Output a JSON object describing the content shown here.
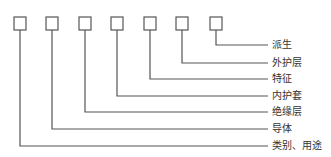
{
  "diagram": {
    "type": "cable-model-code-structure",
    "box_count": 7,
    "labels": [
      "派生",
      "外护层",
      "特征",
      "内护套",
      "绝缘层",
      "导体",
      "类别、用途"
    ],
    "colors": {
      "line": "#555555",
      "text": "#333333",
      "background": "#ffffff"
    }
  }
}
